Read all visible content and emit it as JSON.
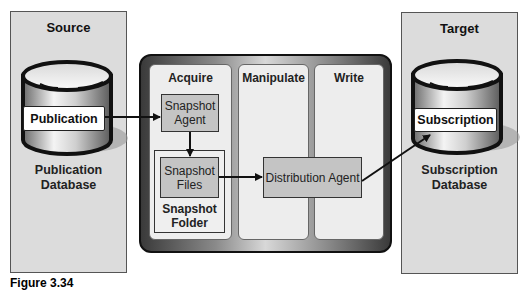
{
  "source": {
    "title": "Source",
    "db_label": "Publication",
    "db_caption_line1": "Publication",
    "db_caption_line2": "Database"
  },
  "target": {
    "title": "Target",
    "db_label": "Subscription",
    "db_caption_line1": "Subscription",
    "db_caption_line2": "Database"
  },
  "pipeline": {
    "panels": [
      {
        "title": "Acquire"
      },
      {
        "title": "Manipulate"
      },
      {
        "title": "Write"
      }
    ],
    "snapshot_agent": {
      "line1": "Snapshot",
      "line2": "Agent"
    },
    "snapshot_files": {
      "line1": "Snapshot",
      "line2": "Files"
    },
    "snapshot_folder": {
      "line1": "Snapshot",
      "line2": "Folder"
    },
    "distribution_agent": "Distribution Agent"
  },
  "caption": "Figure 3.34"
}
